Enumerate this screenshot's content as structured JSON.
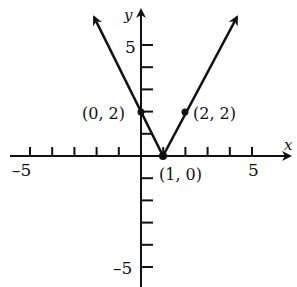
{
  "chart_data": {
    "type": "line",
    "title": "",
    "xlabel": "x",
    "ylabel": "y",
    "xlim": [
      -6,
      6
    ],
    "ylim": [
      -6,
      6
    ],
    "grid": false,
    "x_tick_labels": [
      {
        "value": -5,
        "label": "–5"
      },
      {
        "value": 5,
        "label": "5"
      }
    ],
    "y_tick_labels": [
      {
        "value": 5,
        "label": "5"
      },
      {
        "value": -5,
        "label": "–5"
      }
    ],
    "series": [
      {
        "name": "V-shaped graph y = 2|x − 1|",
        "x": [
          -1.2,
          1,
          3.4
        ],
        "y": [
          6.4,
          0,
          6.4
        ],
        "arrows_at_ends": true
      }
    ],
    "labeled_points": [
      {
        "x": 0,
        "y": 2,
        "label": "(0, 2)"
      },
      {
        "x": 2,
        "y": 2,
        "label": "(2, 2)"
      },
      {
        "x": 1,
        "y": 0,
        "label": "(1, 0)"
      }
    ]
  },
  "colors": {
    "ink": "#111111",
    "background": "#ffffff"
  }
}
